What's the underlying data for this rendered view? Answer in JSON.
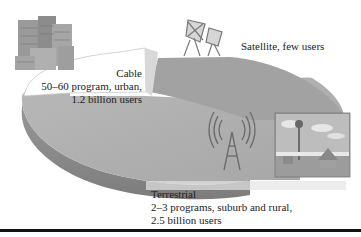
{
  "diagram": {
    "type": "3d-pie-illustration",
    "colors": {
      "cable_slice": "#ffffff",
      "satellite_slice": "#a8a8a8",
      "terrestrial_slice": "#b4b4b4",
      "pie_edge": "#8a8a8a",
      "rule": "#111111"
    },
    "segments": [
      {
        "name": "Cable",
        "lines": [
          "Cable",
          "50–60 program, urban,",
          "1.2 billion users"
        ],
        "icon": "city-buildings-icon"
      },
      {
        "name": "Satellite",
        "lines": [
          "Satellite, few users"
        ],
        "icon": "satellite-dish-icon"
      },
      {
        "name": "Terrestrial",
        "lines": [
          "Terrestrial",
          "2–3 programs, suburb and rural,",
          "2.5 billion users"
        ],
        "icon": "broadcast-tower-icon",
        "photo": "rural-house-with-tower-photo"
      }
    ]
  }
}
